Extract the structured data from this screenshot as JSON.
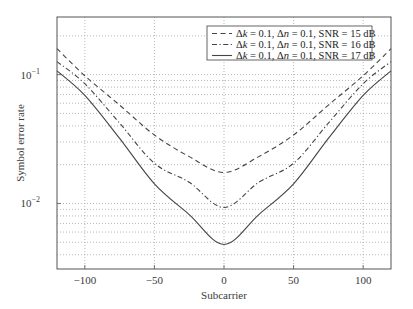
{
  "chart_data": {
    "type": "line",
    "title": "",
    "xlabel": "Subcarrier",
    "ylabel": "Symbol error rate",
    "xlim": [
      -120,
      120
    ],
    "ylim": [
      0.0031,
      0.28
    ],
    "yscale": "log",
    "grid": true,
    "legend_position": "upper right",
    "x_ticks": [
      -100,
      -50,
      0,
      50,
      100
    ],
    "x_tick_labels": [
      "−100",
      "−50",
      "0",
      "50",
      "100"
    ],
    "y_ticks": [
      0.01,
      0.1
    ],
    "y_tick_labels": [
      {
        "base": "10",
        "exp": "−2"
      },
      {
        "base": "10",
        "exp": "−1"
      }
    ],
    "x": [
      -120,
      -100,
      -75,
      -50,
      -25,
      0,
      25,
      50,
      75,
      100,
      120
    ],
    "series": [
      {
        "name": "Δk = 0.1, Δn = 0.1, SNR = 15 dB",
        "legend": {
          "dk": "Δk",
          "dn": "Δn",
          "text1": " = 0.1, ",
          "text2": " = 0.1, SNR = 15 dB"
        },
        "style": "dashed",
        "values": [
          0.159,
          0.098,
          0.058,
          0.034,
          0.0231,
          0.0174,
          0.0231,
          0.034,
          0.058,
          0.098,
          0.159
        ]
      },
      {
        "name": "Δk = 0.1, Δn = 0.1, SNR = 16 dB",
        "legend": {
          "dk": "Δk",
          "dn": "Δn",
          "text1": " = 0.1, ",
          "text2": " = 0.1, SNR = 16 dB"
        },
        "style": "dashdot",
        "values": [
          0.126,
          0.085,
          0.042,
          0.0205,
          0.0146,
          0.0093,
          0.0146,
          0.0205,
          0.042,
          0.085,
          0.126
        ]
      },
      {
        "name": "Δk = 0.1, Δn = 0.1, SNR = 17 dB",
        "legend": {
          "dk": "Δk",
          "dn": "Δn",
          "text1": " = 0.1, ",
          "text2": " = 0.1, SNR = 17 dB"
        },
        "style": "solid",
        "values": [
          0.107,
          0.069,
          0.032,
          0.0142,
          0.0082,
          0.0048,
          0.0082,
          0.0142,
          0.032,
          0.069,
          0.107
        ]
      }
    ]
  },
  "colors": {
    "line": "#444444",
    "grid": "#9a9a9a",
    "frame": "#555555"
  }
}
